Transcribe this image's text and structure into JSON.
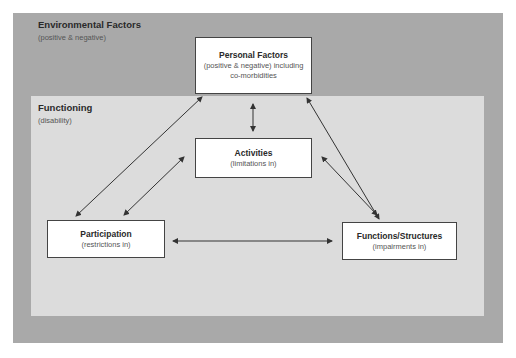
{
  "regions": {
    "environmental": {
      "title": "Environmental Factors",
      "subtitle": "(positive & negative)",
      "color": "#a9a9a9"
    },
    "functioning": {
      "title": "Functioning",
      "subtitle": "(disability)",
      "color": "#dcdcdc"
    }
  },
  "nodes": {
    "personal": {
      "title": "Personal Factors",
      "line1": "(positive & negative) including",
      "line2": "co-morbidities"
    },
    "activities": {
      "title": "Activities",
      "subtitle": "(limitations in)"
    },
    "participation": {
      "title": "Participation",
      "subtitle": "(restrictions in)"
    },
    "functions": {
      "title": "Functions/Structures",
      "subtitle": "(impairments in)"
    }
  },
  "edges": [
    {
      "from": "personal",
      "to": "activities",
      "type": "bidirectional"
    },
    {
      "from": "personal",
      "to": "participation",
      "type": "bidirectional"
    },
    {
      "from": "personal",
      "to": "functions",
      "type": "bidirectional"
    },
    {
      "from": "activities",
      "to": "participation",
      "type": "bidirectional"
    },
    {
      "from": "activities",
      "to": "functions",
      "type": "bidirectional"
    },
    {
      "from": "participation",
      "to": "functions",
      "type": "bidirectional"
    }
  ]
}
